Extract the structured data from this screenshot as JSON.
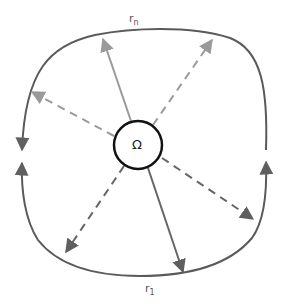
{
  "diagram": {
    "center_symbol": "Ω",
    "labels": {
      "top": {
        "base": "r",
        "sub": "n"
      },
      "bottom": {
        "base": "r",
        "sub": "1"
      }
    },
    "colors": {
      "boundary": "#5a5a5a",
      "circle": "#111111",
      "ray_light": "#9a9a9a",
      "ray_dark": "#666666"
    },
    "rays": [
      {
        "name": "ray-rn",
        "style": "solid",
        "tone": "light",
        "to": [
          103,
          37
        ]
      },
      {
        "name": "ray-r1",
        "style": "solid",
        "tone": "dark",
        "to": [
          183,
          274
        ]
      },
      {
        "name": "ray-ne",
        "style": "dashed",
        "tone": "light",
        "to": [
          213,
          37
        ]
      },
      {
        "name": "ray-nw",
        "style": "dashed",
        "tone": "light",
        "to": [
          30,
          91
        ]
      },
      {
        "name": "ray-se",
        "style": "dashed",
        "tone": "dark",
        "to": [
          255,
          220
        ]
      },
      {
        "name": "ray-sw",
        "style": "dashed",
        "tone": "dark",
        "to": [
          64,
          254
        ]
      }
    ]
  }
}
